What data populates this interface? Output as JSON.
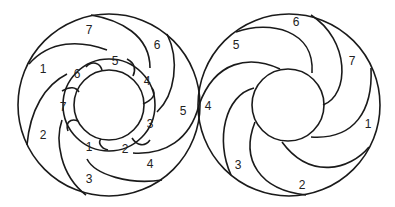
{
  "figure": {
    "left_wheel": {
      "outer_ring_labels": [
        "1",
        "2",
        "3",
        "4",
        "5",
        "6",
        "7"
      ],
      "inner_ring_labels": [
        "1",
        "2",
        "3",
        "4",
        "5",
        "6",
        "7"
      ]
    },
    "right_wheel": {
      "ring_labels": [
        "1",
        "2",
        "3",
        "4",
        "5",
        "6",
        "7"
      ]
    }
  },
  "labels": {
    "L_out_7": "7",
    "L_out_6": "6",
    "L_out_1": "1",
    "L_out_5": "5",
    "L_out_2": "2",
    "L_out_4": "4",
    "L_out_3": "3",
    "L_in_5": "5",
    "L_in_6": "6",
    "L_in_4": "4",
    "L_in_7": "7",
    "L_in_3": "3",
    "L_in_1": "1",
    "L_in_2": "2",
    "R_6": "6",
    "R_5": "5",
    "R_7": "7",
    "R_4": "4",
    "R_1": "1",
    "R_3": "3",
    "R_2": "2"
  },
  "colors": {
    "stroke": "#1a1a1a",
    "background": "#ffffff"
  }
}
